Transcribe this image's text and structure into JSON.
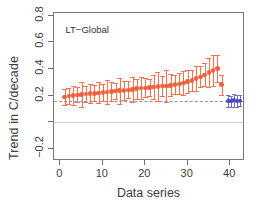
{
  "chart_data": {
    "type": "scatter",
    "title": "",
    "annotation": "LT−Global",
    "xlabel": "Data series",
    "ylabel": "Trend in C/decade",
    "xlim": [
      -1.5,
      43.5
    ],
    "ylim": [
      -0.29,
      0.82
    ],
    "grid": false,
    "legend_position": "none",
    "xticks": [
      0,
      10,
      20,
      30,
      40
    ],
    "xticklabels": [
      "0",
      "10",
      "20",
      "30",
      "40"
    ],
    "yticks": [
      -0.2,
      0.0,
      0.2,
      0.4,
      0.6,
      0.8
    ],
    "yticklabels": [
      "−0.2",
      "",
      "0.2",
      "0.4",
      "0.6",
      "0.8"
    ],
    "reference_line": {
      "y": 0.16,
      "style": "dashed",
      "color": "#8b93c7"
    },
    "zero_line": {
      "y": 0.0,
      "style": "solid",
      "color": "#d0d0d0"
    },
    "series": [
      {
        "name": "orange-series",
        "color": "#f4603c",
        "errorbar_color": "#f4714c",
        "marker": "circle",
        "x": [
          1,
          2,
          3,
          4,
          5,
          6,
          7,
          8,
          9,
          10,
          11,
          12,
          13,
          14,
          15,
          16,
          17,
          18,
          19,
          20,
          21,
          22,
          23,
          24,
          25,
          26,
          27,
          28,
          29,
          30,
          31,
          32,
          33,
          34,
          35,
          36,
          37,
          38
        ],
        "y": [
          0.19,
          0.196,
          0.201,
          0.206,
          0.209,
          0.212,
          0.215,
          0.218,
          0.221,
          0.224,
          0.228,
          0.231,
          0.234,
          0.237,
          0.24,
          0.244,
          0.248,
          0.252,
          0.256,
          0.259,
          0.262,
          0.265,
          0.268,
          0.271,
          0.274,
          0.278,
          0.283,
          0.289,
          0.296,
          0.305,
          0.315,
          0.327,
          0.34,
          0.355,
          0.372,
          0.388,
          0.402,
          0.282
        ],
        "yerr_low": [
          0.058,
          0.062,
          0.072,
          0.055,
          0.092,
          0.06,
          0.072,
          0.058,
          0.076,
          0.062,
          0.09,
          0.068,
          0.06,
          0.096,
          0.07,
          0.062,
          0.092,
          0.074,
          0.084,
          0.07,
          0.062,
          0.09,
          0.108,
          0.072,
          0.118,
          0.082,
          0.072,
          0.078,
          0.09,
          0.086,
          0.078,
          0.092,
          0.078,
          0.086,
          0.106,
          0.118,
          0.1,
          0.074
        ],
        "yerr_high": [
          0.06,
          0.064,
          0.074,
          0.058,
          0.094,
          0.062,
          0.074,
          0.06,
          0.078,
          0.064,
          0.092,
          0.07,
          0.062,
          0.098,
          0.072,
          0.064,
          0.094,
          0.076,
          0.086,
          0.072,
          0.064,
          0.092,
          0.11,
          0.074,
          0.12,
          0.084,
          0.074,
          0.08,
          0.092,
          0.088,
          0.08,
          0.094,
          0.08,
          0.088,
          0.108,
          0.12,
          0.102,
          0.076
        ]
      },
      {
        "name": "blue-series",
        "color": "#4a4ac8",
        "errorbar_color": "#6f6fd0",
        "marker": "circle",
        "x": [
          39.6,
          40.3,
          41.0,
          41.7,
          42.3
        ],
        "y": [
          0.162,
          0.158,
          0.166,
          0.16,
          0.163
        ],
        "yerr_low": [
          0.044,
          0.04,
          0.048,
          0.042,
          0.04
        ],
        "yerr_high": [
          0.046,
          0.042,
          0.05,
          0.044,
          0.042
        ]
      }
    ]
  }
}
